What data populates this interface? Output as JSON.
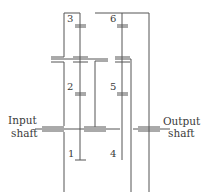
{
  "diagram": {
    "labels": {
      "input_line1": "Input",
      "input_line2": "shaft",
      "output_line1": "Output",
      "output_line2": "shaft"
    },
    "gears": [
      {
        "id": "1",
        "label": "1"
      },
      {
        "id": "2",
        "label": "2"
      },
      {
        "id": "3",
        "label": "3"
      },
      {
        "id": "4",
        "label": "4"
      },
      {
        "id": "5",
        "label": "5"
      },
      {
        "id": "6",
        "label": "6"
      }
    ],
    "colors": {
      "line": "#555555",
      "text": "#3a3a3a",
      "background": "#ffffff"
    }
  }
}
